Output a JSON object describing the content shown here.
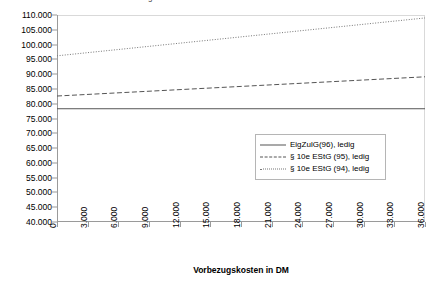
{
  "title_fragment": "g",
  "chart_data": {
    "type": "line",
    "title": "",
    "xlabel": "Vorbezugskosten in DM",
    "ylabel": "Endwertvorteil in DM",
    "xlim": [
      0,
      36000
    ],
    "ylim": [
      40000,
      110000
    ],
    "grid": false,
    "legend_position": "inside-lower-right",
    "xticks": [
      "0",
      "3.000",
      "6.000",
      "9.000",
      "12.000",
      "15.000",
      "18.000",
      "21.000",
      "24.000",
      "27.000",
      "30.000",
      "33.000",
      "36.000"
    ],
    "xtick_values": [
      0,
      3000,
      6000,
      9000,
      12000,
      15000,
      18000,
      21000,
      24000,
      27000,
      30000,
      33000,
      36000
    ],
    "yticks": [
      "40.000",
      "45.000",
      "50.000",
      "55.000",
      "60.000",
      "65.000",
      "70.000",
      "75.000",
      "80.000",
      "85.000",
      "90.000",
      "95.000",
      "100.000",
      "105.000",
      "110.000"
    ],
    "ytick_values": [
      40000,
      45000,
      50000,
      55000,
      60000,
      65000,
      70000,
      75000,
      80000,
      85000,
      90000,
      95000,
      100000,
      105000,
      110000
    ],
    "x": [
      0,
      36000
    ],
    "series": [
      {
        "name": "EigZulG(96), ledig",
        "style": "solid",
        "color": "#555555",
        "values": [
          78300,
          78300
        ]
      },
      {
        "name": "§ 10e EStG (95), ledig",
        "style": "dashed",
        "color": "#555555",
        "values": [
          82600,
          89100
        ]
      },
      {
        "name": "§ 10e EStG (94), ledig",
        "style": "dotted",
        "color": "#777777",
        "values": [
          96200,
          109000
        ]
      }
    ]
  }
}
